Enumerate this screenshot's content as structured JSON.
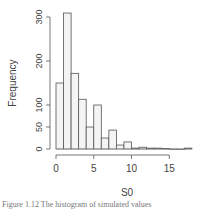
{
  "chart_data": {
    "type": "bar",
    "subtype": "histogram",
    "title": "",
    "xlabel": "S0",
    "ylabel": "Frequency",
    "bin_width": 1,
    "bins": [
      {
        "x0": 0,
        "x1": 1,
        "count": 150
      },
      {
        "x0": 1,
        "x1": 2,
        "count": 309
      },
      {
        "x0": 2,
        "x1": 3,
        "count": 172
      },
      {
        "x0": 3,
        "x1": 4,
        "count": 113
      },
      {
        "x0": 4,
        "x1": 5,
        "count": 50
      },
      {
        "x0": 5,
        "x1": 6,
        "count": 100
      },
      {
        "x0": 6,
        "x1": 7,
        "count": 25
      },
      {
        "x0": 7,
        "x1": 8,
        "count": 43
      },
      {
        "x0": 8,
        "x1": 9,
        "count": 9
      },
      {
        "x0": 9,
        "x1": 10,
        "count": 16
      },
      {
        "x0": 10,
        "x1": 11,
        "count": 2
      },
      {
        "x0": 11,
        "x1": 12,
        "count": 4
      },
      {
        "x0": 12,
        "x1": 13,
        "count": 2
      },
      {
        "x0": 13,
        "x1": 14,
        "count": 2
      },
      {
        "x0": 14,
        "x1": 15,
        "count": 1
      },
      {
        "x0": 15,
        "x1": 16,
        "count": 0
      },
      {
        "x0": 16,
        "x1": 17,
        "count": 0
      },
      {
        "x0": 17,
        "x1": 18,
        "count": 2
      }
    ],
    "x_ticks": [
      0,
      5,
      10,
      15
    ],
    "y_ticks": [
      0,
      50,
      100,
      200,
      300
    ],
    "xlim": [
      0,
      18
    ],
    "ylim": [
      0,
      310
    ],
    "grid": false,
    "legend": null
  },
  "caption": "Figure 1.12  The histogram of simulated values"
}
